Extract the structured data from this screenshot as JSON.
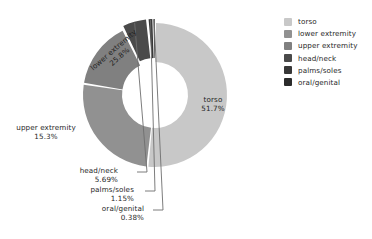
{
  "chart_data": {
    "type": "pie",
    "variant": "donut",
    "title": "",
    "xlabel": "",
    "ylabel": "",
    "units": "percent",
    "total": 100.0,
    "start_angle_deg": 0,
    "direction": "clockwise",
    "grid": false,
    "legend_position": "right",
    "categories": [
      "torso",
      "lower extremity",
      "upper extremity",
      "head/neck",
      "palms/soles",
      "oral/genital"
    ],
    "values": [
      51.7,
      25.8,
      15.3,
      5.69,
      1.15,
      0.38
    ],
    "value_labels": [
      "51.7%",
      "25.8%",
      "15.3%",
      "5.69%",
      "1.15%",
      "0.38%"
    ],
    "colors": [
      "#c8c8c8",
      "#919191",
      "#808080",
      "#4a4a4a",
      "#383838",
      "#2b2b2b"
    ],
    "slices": [
      {
        "name": "torso",
        "value": 51.7,
        "label": "torso",
        "pct": "51.7%",
        "color": "#c8c8c8",
        "label_placement": "inside"
      },
      {
        "name": "lower extremity",
        "value": 25.8,
        "label": "lower extremity",
        "pct": "25.8%",
        "color": "#919191",
        "label_placement": "inside-rotated"
      },
      {
        "name": "upper extremity",
        "value": 15.3,
        "label": "upper extremity",
        "pct": "15.3%",
        "color": "#808080",
        "label_placement": "outside"
      },
      {
        "name": "head/neck",
        "value": 5.69,
        "label": "head/neck",
        "pct": "5.69%",
        "color": "#4a4a4a",
        "label_placement": "leader-line"
      },
      {
        "name": "palms/soles",
        "value": 1.15,
        "label": "palms/soles",
        "pct": "1.15%",
        "color": "#383838",
        "label_placement": "leader-line"
      },
      {
        "name": "oral/genital",
        "value": 0.38,
        "label": "oral/genital",
        "pct": "0.38%",
        "color": "#2b2b2b",
        "label_placement": "leader-line"
      }
    ]
  },
  "labels": {
    "torso": {
      "name": "torso",
      "pct": "51.7%"
    },
    "lower": {
      "name": "lower extremity",
      "pct": "25.8%"
    },
    "upper": {
      "name": "upper extremity",
      "pct": "15.3%"
    },
    "head": {
      "name": "head/neck",
      "pct": "5.69%"
    },
    "palms": {
      "name": "palms/soles",
      "pct": "1.15%"
    },
    "oral": {
      "name": "oral/genital",
      "pct": "0.38%"
    }
  },
  "legend": {
    "items": [
      {
        "label": "torso",
        "color": "#c8c8c8"
      },
      {
        "label": "lower extremity",
        "color": "#919191"
      },
      {
        "label": "upper extremity",
        "color": "#808080"
      },
      {
        "label": "head/neck",
        "color": "#4a4a4a"
      },
      {
        "label": "palms/soles",
        "color": "#383838"
      },
      {
        "label": "oral/genital",
        "color": "#2b2b2b"
      }
    ]
  },
  "style": {
    "background": "#ffffff",
    "text_color": "#1f1f1f",
    "leader_line_color": "#6e6e6e"
  }
}
